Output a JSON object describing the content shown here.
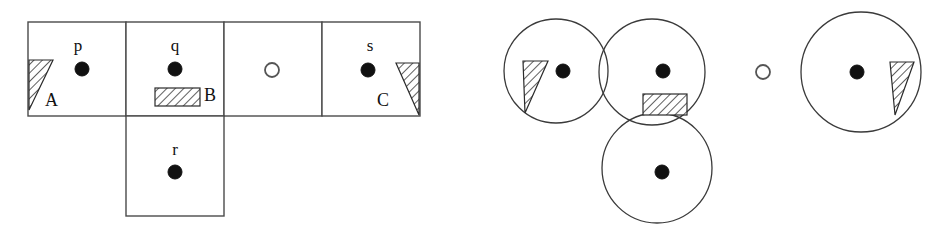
{
  "figure": {
    "title": "",
    "background_color": "#ffffff",
    "line_color": "#4a4a4a",
    "fill_color": "#ffffff",
    "dot_color": "#111111",
    "hatch_color": "#2b2b2b"
  },
  "left_diagram": {
    "name": "grid-cells-diagram",
    "agent_labels": [
      {
        "id": "p",
        "text": "p",
        "x": 82,
        "y": 46,
        "dot_x": 82,
        "dot_y": 69
      },
      {
        "id": "q",
        "text": "q",
        "x": 175,
        "y": 46,
        "dot_x": 175,
        "dot_y": 69
      },
      {
        "id": "s",
        "text": "s",
        "x": 370,
        "y": 46,
        "dot_x": 370,
        "dot_y": 70
      },
      {
        "id": "r",
        "text": "r",
        "x": 175,
        "y": 150,
        "dot_x": 175,
        "dot_y": 172
      }
    ],
    "goal": {
      "id": "goal",
      "x": 272,
      "y": 70,
      "radius": 7
    },
    "obstacle_labels": [
      {
        "id": "A",
        "text": "A",
        "x": 47,
        "y": 103
      },
      {
        "id": "B",
        "text": "B",
        "x": 205,
        "y": 100
      },
      {
        "id": "C",
        "text": "C",
        "x": 387,
        "y": 103
      }
    ],
    "cells": [
      {
        "id": "cell-p",
        "x": 28,
        "y": 22,
        "w": 98,
        "h": 94
      },
      {
        "id": "cell-q",
        "x": 126,
        "y": 22,
        "w": 98,
        "h": 94
      },
      {
        "id": "cell-goal",
        "x": 224,
        "y": 22,
        "w": 98,
        "h": 94
      },
      {
        "id": "cell-s",
        "x": 322,
        "y": 22,
        "w": 98,
        "h": 94
      },
      {
        "id": "cell-r",
        "x": 126,
        "y": 116,
        "w": 98,
        "h": 100
      }
    ]
  },
  "right_diagram": {
    "name": "sensor-range-diagram",
    "circles": [
      {
        "id": "circle-p",
        "cx": 556,
        "cy": 71,
        "r": 52
      },
      {
        "id": "circle-q",
        "cx": 652,
        "cy": 72,
        "r": 53
      },
      {
        "id": "circle-r",
        "cx": 657,
        "cy": 168,
        "r": 55
      },
      {
        "id": "circle-s",
        "cx": 861,
        "cy": 72,
        "r": 60
      }
    ],
    "agents": [
      {
        "id": "p",
        "dot_x": 563,
        "dot_y": 71
      },
      {
        "id": "q",
        "dot_x": 663,
        "dot_y": 71
      },
      {
        "id": "r",
        "dot_x": 662,
        "dot_y": 172
      },
      {
        "id": "s",
        "dot_x": 857,
        "dot_y": 72
      }
    ],
    "goal": {
      "id": "goal",
      "x": 763,
      "y": 72,
      "radius": 7
    }
  }
}
